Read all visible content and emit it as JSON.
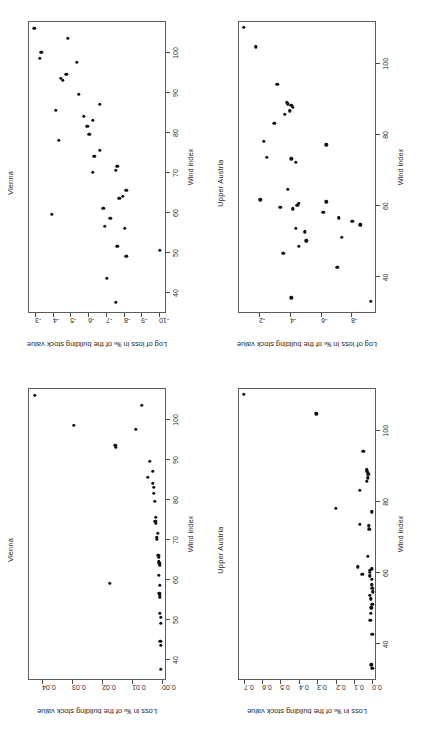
{
  "figure": {
    "layout": "2x2 grid of scatter plots, page rotated 90 degrees",
    "page_rotation_deg": -90
  },
  "chart_data": [
    {
      "id": "vienna-log",
      "position": "top-left",
      "type": "scatter",
      "title": "Vienna",
      "xlabel": "Wind index",
      "ylabel": "Log of loss in ‰ of the building stock value",
      "xlim": [
        35,
        108
      ],
      "ylim": [
        -10.4,
        -2.6
      ],
      "xticks": [
        40,
        50,
        60,
        70,
        80,
        90,
        100
      ],
      "yticks": [
        -3,
        -4,
        -5,
        -6,
        -7,
        -8,
        -9,
        -10
      ],
      "grid": false,
      "legend": "none",
      "x": [
        37.5,
        43.5,
        49.0,
        50.5,
        51.5,
        56.0,
        56.5,
        58.5,
        59.5,
        61.0,
        63.5,
        64.0,
        65.5,
        70.0,
        70.5,
        71.5,
        74.0,
        75.5,
        78.0,
        79.5,
        81.5,
        83.0,
        84.0,
        85.5,
        87.0,
        89.5,
        93.0,
        93.5,
        94.5,
        97.5,
        98.5,
        100.0,
        103.5,
        106.0
      ],
      "y": [
        -7.5,
        -7.0,
        -8.1,
        -10.0,
        -7.6,
        -8.0,
        -6.9,
        -7.2,
        -3.9,
        -6.8,
        -7.7,
        -7.9,
        -8.1,
        -6.2,
        -7.5,
        -7.6,
        -6.3,
        -6.6,
        -4.3,
        -6.0,
        -5.9,
        -6.2,
        -5.7,
        -4.1,
        -6.6,
        -5.4,
        -4.5,
        -4.4,
        -4.7,
        -5.3,
        -3.2,
        -3.3,
        -4.8,
        -2.9
      ]
    },
    {
      "id": "upper-austria-log",
      "position": "top-right",
      "type": "scatter",
      "title": "Upper Austria",
      "xlabel": "Wind index",
      "ylabel": "Log of loss in ‰ of the building stock value",
      "xlim": [
        30,
        112
      ],
      "ylim": [
        -9.6,
        -0.6
      ],
      "xticks": [
        40,
        60,
        80,
        100
      ],
      "yticks": [
        -2,
        -4,
        -6,
        -8
      ],
      "grid": false,
      "legend": "none",
      "x": [
        33.0,
        34.0,
        42.5,
        46.5,
        48.5,
        50.0,
        51.0,
        52.5,
        53.5,
        54.5,
        55.5,
        56.5,
        58.0,
        59.0,
        59.5,
        60.0,
        60.5,
        61.0,
        61.5,
        64.5,
        72.0,
        73.0,
        73.5,
        77.0,
        78.0,
        83.0,
        85.5,
        86.5,
        87.5,
        88.0,
        88.5,
        89.0,
        94.0,
        104.5,
        110.0
      ],
      "y": [
        -9.2,
        -4.0,
        -7.0,
        -3.5,
        -4.5,
        -5.0,
        -7.3,
        -4.9,
        -4.3,
        -8.5,
        -8.0,
        -7.1,
        -6.1,
        -4.1,
        -3.3,
        -4.4,
        -4.5,
        -6.3,
        -2.0,
        -3.8,
        -4.3,
        -4.0,
        -2.4,
        -6.3,
        -2.2,
        -2.9,
        -3.6,
        -3.9,
        -4.1,
        -4.0,
        -3.8,
        -3.7,
        -3.1,
        -1.7,
        -0.9
      ]
    },
    {
      "id": "vienna-linear",
      "position": "bottom-left",
      "type": "scatter",
      "title": "Vienna",
      "xlabel": "Wind index",
      "ylabel": "Loss in ‰ of the building stock value",
      "xlim": [
        35,
        108
      ],
      "ylim": [
        -0.0015,
        0.0445
      ],
      "xticks": [
        40,
        50,
        60,
        70,
        80,
        90,
        100
      ],
      "yticks": [
        0.0,
        0.01,
        0.02,
        0.03,
        0.04
      ],
      "ytick_labels": [
        "0.00",
        "0.01",
        "0.02",
        "0.03",
        "0.04"
      ],
      "grid": false,
      "legend": "none",
      "x": [
        37.5,
        43.5,
        44.5,
        49.0,
        50.5,
        51.5,
        55.5,
        56.0,
        56.5,
        58.5,
        59.0,
        61.0,
        63.5,
        64.0,
        64.5,
        65.5,
        66.0,
        70.0,
        70.5,
        71.5,
        74.0,
        74.5,
        75.5,
        79.5,
        81.5,
        83.0,
        84.0,
        85.5,
        87.0,
        89.5,
        93.0,
        93.5,
        97.5,
        98.5,
        103.5,
        106.0
      ],
      "y": [
        0.0005,
        0.0005,
        0.0007,
        0.0006,
        0.0006,
        0.0008,
        0.0008,
        0.0009,
        0.0011,
        0.001,
        0.0175,
        0.0012,
        0.001,
        0.0011,
        0.0013,
        0.0012,
        0.0014,
        0.002,
        0.0018,
        0.0016,
        0.0022,
        0.0024,
        0.0023,
        0.0026,
        0.003,
        0.0029,
        0.0033,
        0.0048,
        0.0032,
        0.0042,
        0.0155,
        0.0157,
        0.0088,
        0.0295,
        0.0068,
        0.0425
      ]
    },
    {
      "id": "upper-austria-linear",
      "position": "bottom-right",
      "type": "scatter",
      "title": "Upper Austria",
      "xlabel": "Wind index",
      "ylabel": "Loss in ‰ of the building stock value",
      "xlim": [
        30,
        112
      ],
      "ylim": [
        -0.02,
        0.73
      ],
      "xticks": [
        40,
        60,
        80,
        100
      ],
      "yticks": [
        0.0,
        0.1,
        0.2,
        0.3,
        0.4,
        0.5,
        0.6,
        0.7
      ],
      "ytick_labels": [
        "0.0",
        "0.1",
        "0.2",
        "0.3",
        "0.4",
        "0.5",
        "0.6",
        "0.7"
      ],
      "grid": false,
      "legend": "none",
      "x": [
        33.0,
        34.0,
        42.5,
        46.5,
        48.5,
        50.0,
        51.0,
        52.5,
        53.5,
        54.5,
        55.5,
        56.5,
        58.0,
        59.0,
        59.5,
        60.0,
        60.5,
        61.0,
        61.5,
        64.5,
        72.0,
        73.0,
        73.5,
        77.0,
        78.0,
        83.0,
        85.5,
        86.5,
        87.5,
        88.0,
        88.5,
        89.0,
        94.0,
        104.5,
        110.0
      ],
      "y": [
        0.005,
        0.01,
        0.006,
        0.016,
        0.013,
        0.012,
        0.006,
        0.013,
        0.018,
        0.004,
        0.005,
        0.007,
        0.009,
        0.02,
        0.06,
        0.019,
        0.018,
        0.008,
        0.085,
        0.03,
        0.022,
        0.026,
        0.072,
        0.008,
        0.205,
        0.075,
        0.035,
        0.031,
        0.028,
        0.03,
        0.034,
        0.036,
        0.055,
        0.31,
        0.705
      ]
    }
  ]
}
